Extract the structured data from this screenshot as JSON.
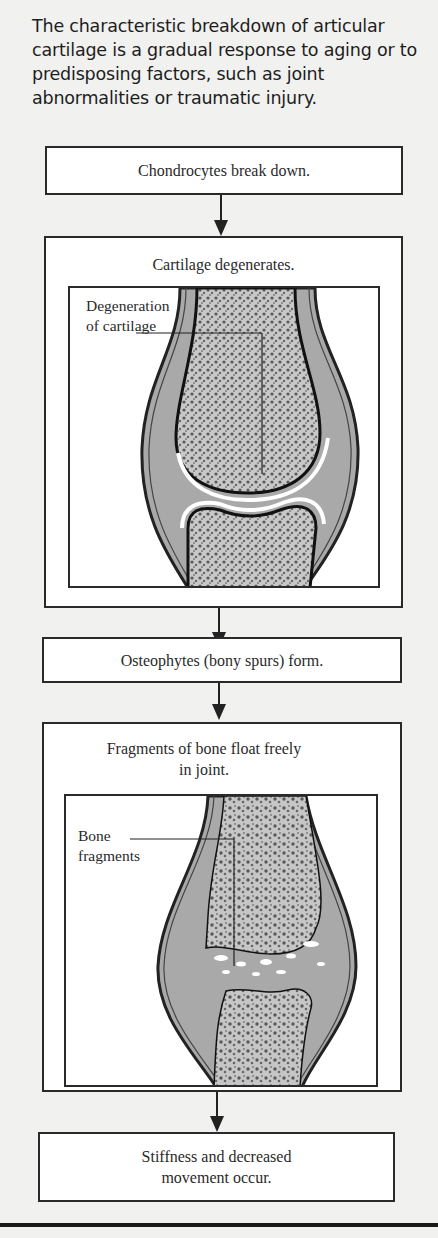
{
  "intro_text": "The characteristic breakdown of articular cartilage is a gradual response to aging or to predisposing factors, such as joint abnormalities or traumatic injury.",
  "flow": {
    "step1": "Chondrocytes break down.",
    "step2": "Cartilage degenerates.",
    "step2_callout_line1": "Degeneration",
    "step2_callout_line2": "of cartilage",
    "step3": "Osteophytes (bony spurs) form.",
    "step4_line1": "Fragments of bone float freely",
    "step4_line2": "in joint.",
    "step4_callout_line1": "Bone",
    "step4_callout_line2": "fragments",
    "step5_line1": "Stiffness and decreased",
    "step5_line2": "movement occur."
  },
  "colors": {
    "background": "#f1f1f0",
    "box_border": "#2a2a2a",
    "joint_fill": "#a9a9a9",
    "bone_fill": "#c4c4c4",
    "cartilage": "#ffffff"
  }
}
